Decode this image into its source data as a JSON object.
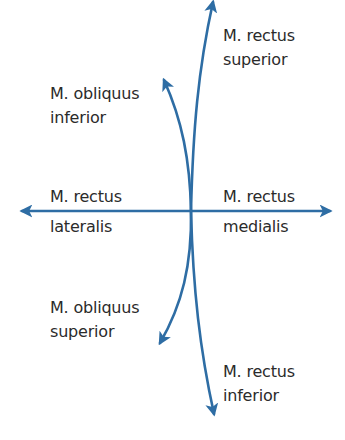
{
  "diagram": {
    "type": "eye-muscle-action-directions",
    "colors": {
      "arrow": "#2e6da4",
      "text": "#2b2b2b",
      "background": "#ffffff"
    },
    "center": {
      "x": 191,
      "y": 211
    },
    "muscles": [
      {
        "id": "rectus-superior",
        "line1": "M. rectus",
        "line2": "superior"
      },
      {
        "id": "obliquus-inferior",
        "line1": "M. obliquus",
        "line2": "inferior"
      },
      {
        "id": "rectus-lateralis",
        "line1": "M. rectus",
        "line2": "lateralis"
      },
      {
        "id": "rectus-medialis",
        "line1": "M. rectus",
        "line2": "medialis"
      },
      {
        "id": "obliquus-superior",
        "line1": "M. obliquus",
        "line2": "superior"
      },
      {
        "id": "rectus-inferior",
        "line1": "M. rectus",
        "line2": "inferior"
      }
    ]
  }
}
